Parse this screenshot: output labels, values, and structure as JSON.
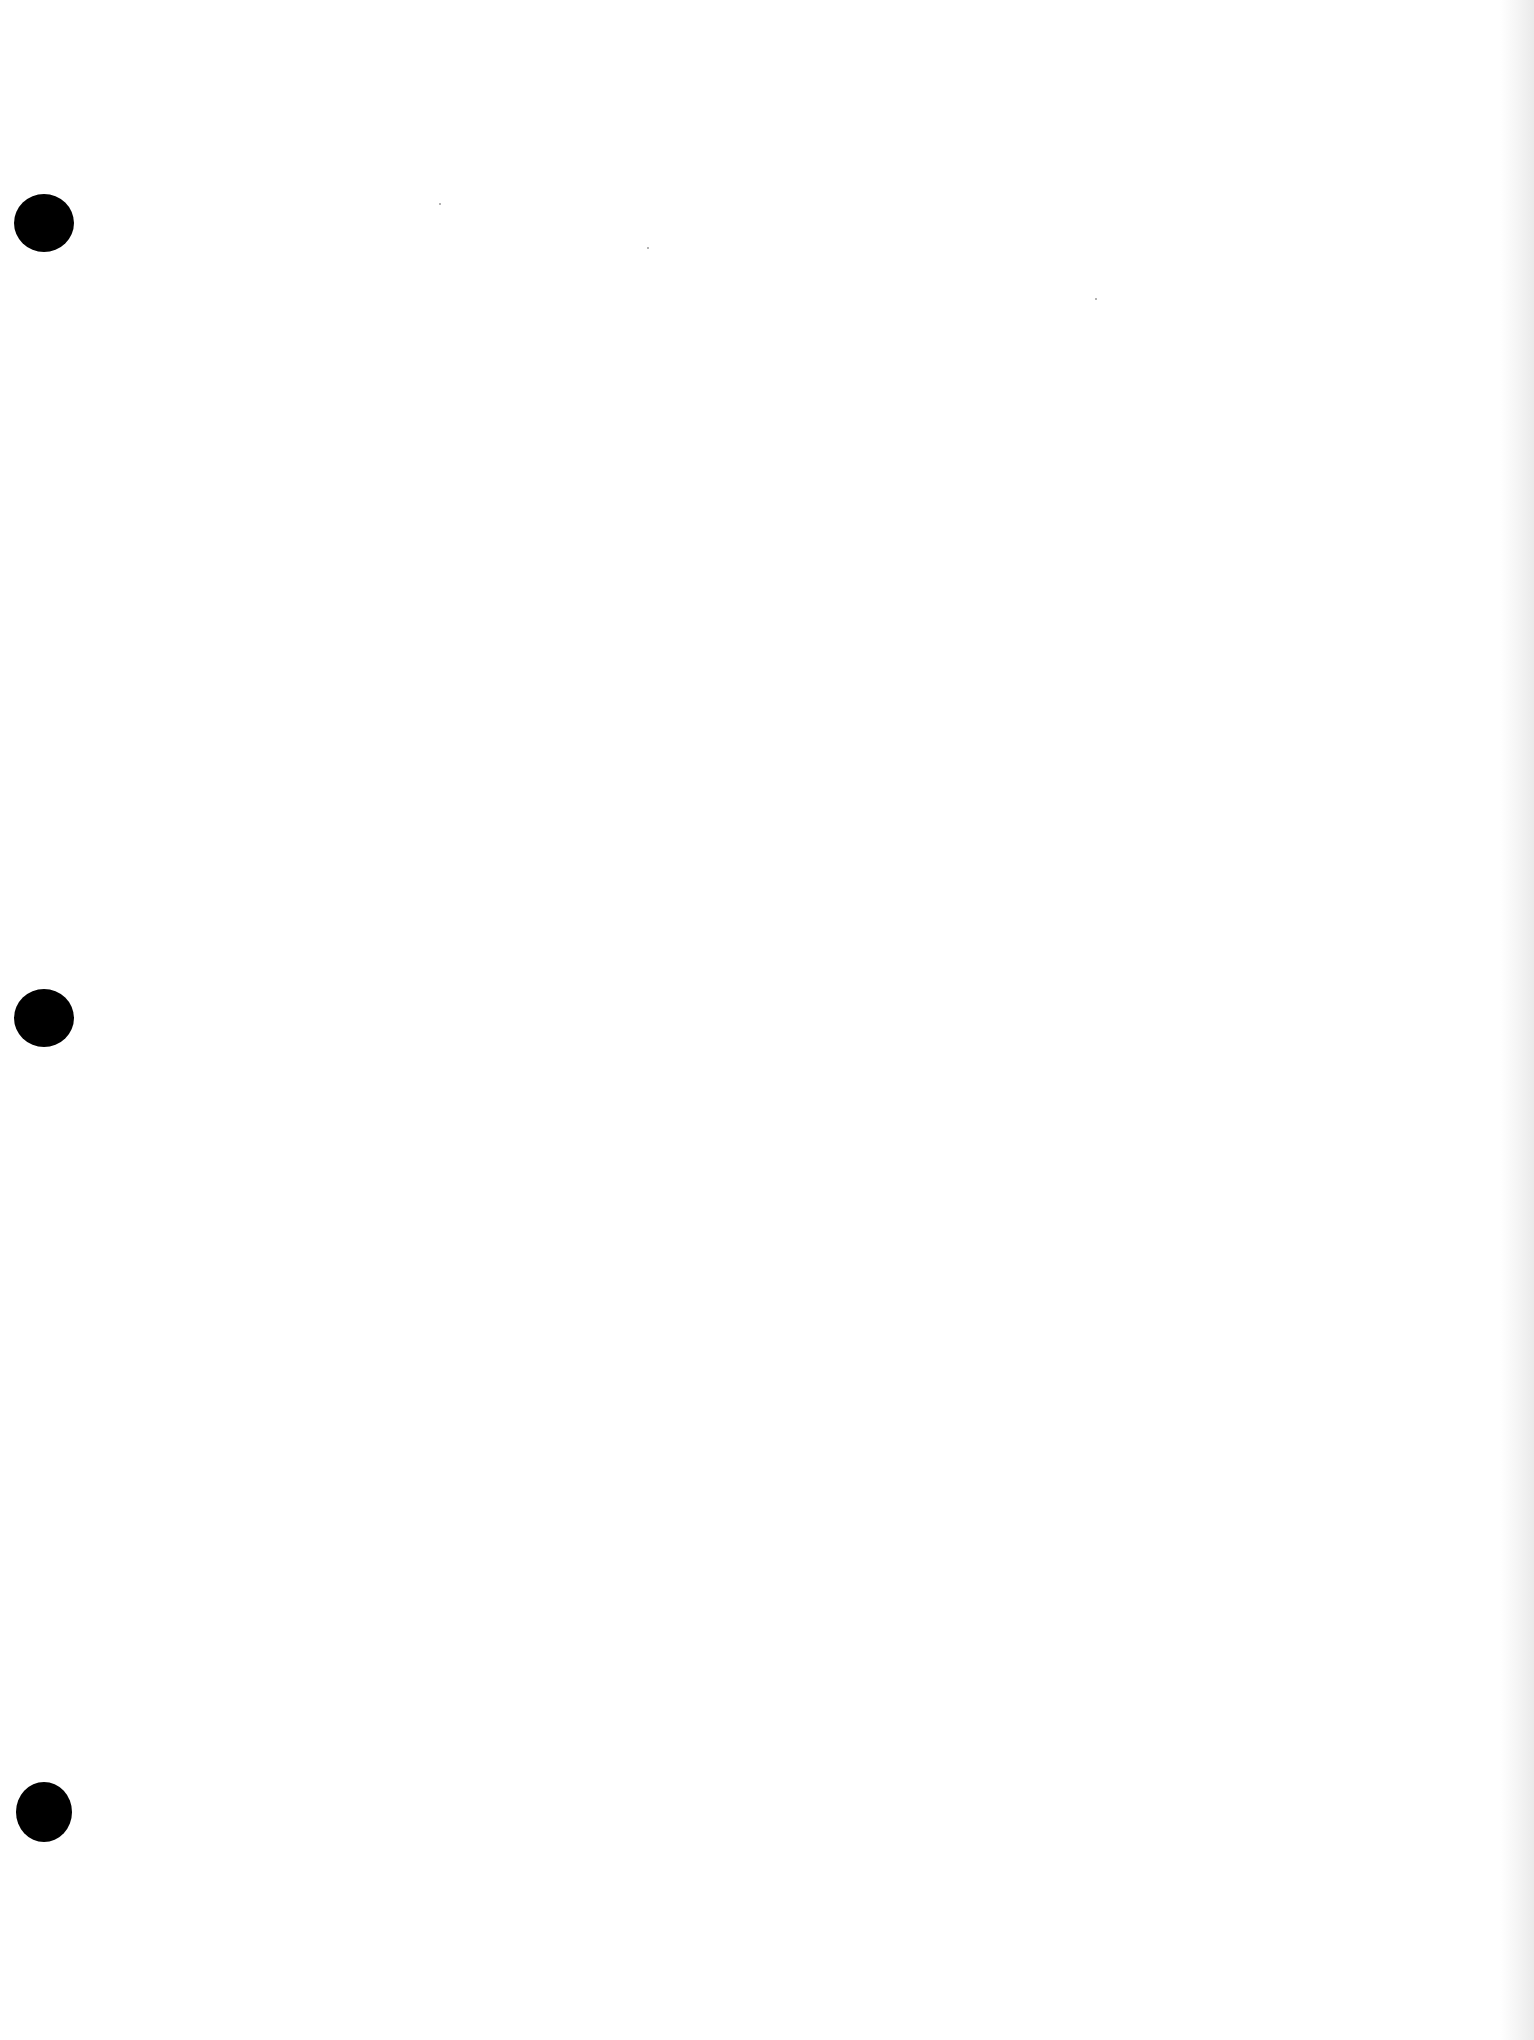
{
  "document": {
    "type": "blank scanned page",
    "background_color": "#ffffff",
    "edge_shadow_color": "#e8e8e8",
    "punch_holes": [
      {
        "id": "top",
        "x": 14,
        "y": 194,
        "color": "#000000"
      },
      {
        "id": "middle",
        "x": 14,
        "y": 989,
        "color": "#000000"
      },
      {
        "id": "bottom",
        "x": 16,
        "y": 1782,
        "color": "#000000"
      }
    ],
    "text_content": ""
  }
}
